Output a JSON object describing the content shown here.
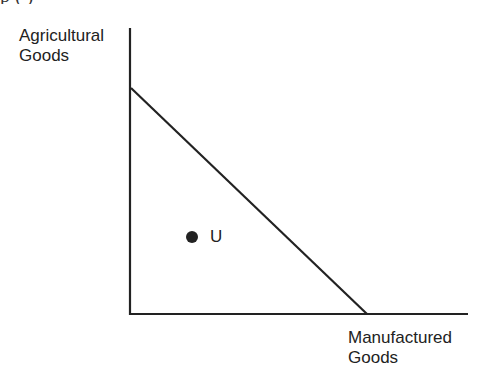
{
  "diagram": {
    "type": "production-possibilities-frontier",
    "clipped_top_text": "p   (   )",
    "y_axis": {
      "label_lines": [
        "Agricultural",
        "Goods"
      ]
    },
    "x_axis": {
      "label_lines": [
        "Manufactured",
        "Goods"
      ]
    },
    "frontier": {
      "shape": "straight-line",
      "y_intercept_px": [
        131,
        88
      ],
      "x_intercept_px": [
        367,
        314
      ]
    },
    "points": [
      {
        "label": "U",
        "position": "inside-frontier",
        "px": [
          192,
          237
        ]
      }
    ],
    "colors": {
      "line": "#222222",
      "background": "#ffffff",
      "text": "#222222"
    }
  }
}
